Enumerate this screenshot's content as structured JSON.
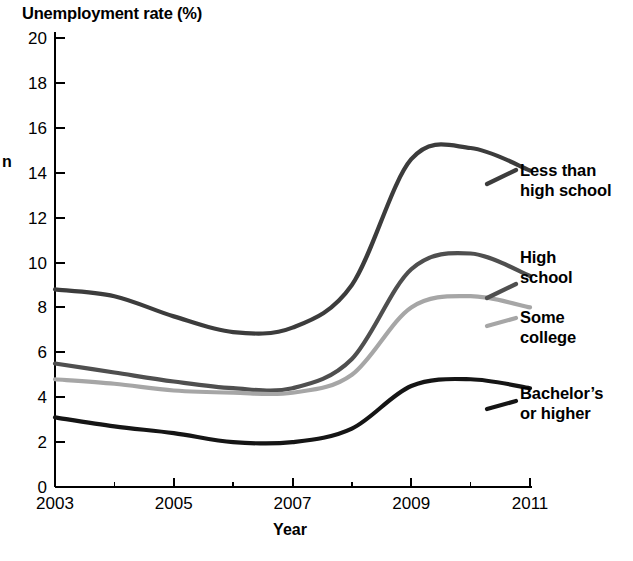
{
  "chart_data": {
    "type": "line",
    "title": "Unemployment rate (%)",
    "xlabel": "Year",
    "ylabel_fragment": "n",
    "xlim": [
      2003,
      2011
    ],
    "ylim": [
      0,
      20
    ],
    "grid": false,
    "legend_position": "right-inline",
    "y_ticks": [
      "0",
      "2",
      "4",
      "6",
      "8",
      "10",
      "12",
      "14",
      "16",
      "18",
      "20"
    ],
    "y_tick_values": [
      0,
      2,
      4,
      6,
      8,
      10,
      12,
      14,
      16,
      18,
      20
    ],
    "x_ticks": [
      "2003",
      "2005",
      "2007",
      "2009",
      "2011"
    ],
    "x_tick_values": [
      2003,
      2005,
      2007,
      2009,
      2011
    ],
    "x_minor_ticks": [
      2004,
      2006,
      2008,
      2010
    ],
    "x": [
      2003,
      2004,
      2005,
      2006,
      2007,
      2008,
      2009,
      2010,
      2011
    ],
    "series": [
      {
        "name": "Less than high school",
        "color": "#3c3c3c",
        "values": [
          8.8,
          8.5,
          7.6,
          6.9,
          7.1,
          9.0,
          14.6,
          15.1,
          14.1
        ]
      },
      {
        "name": "High school",
        "color": "#4f4f4f",
        "values": [
          5.5,
          5.1,
          4.7,
          4.4,
          4.4,
          5.7,
          9.7,
          10.4,
          9.4
        ]
      },
      {
        "name": "Some college",
        "color": "#a6a6a6",
        "values": [
          4.8,
          4.6,
          4.3,
          4.2,
          4.2,
          5.0,
          8.0,
          8.5,
          8.0
        ]
      },
      {
        "name": "Bachelor's or higher",
        "color": "#151515",
        "values": [
          3.1,
          2.7,
          2.4,
          2.0,
          2.0,
          2.6,
          4.5,
          4.8,
          4.4
        ]
      }
    ]
  },
  "legend": [
    {
      "line1": "Less than",
      "line2": "high school"
    },
    {
      "line1": "High",
      "line2": "school"
    },
    {
      "line1": "Some",
      "line2": "college"
    },
    {
      "line1": "Bachelor’s",
      "line2": "or higher"
    }
  ]
}
